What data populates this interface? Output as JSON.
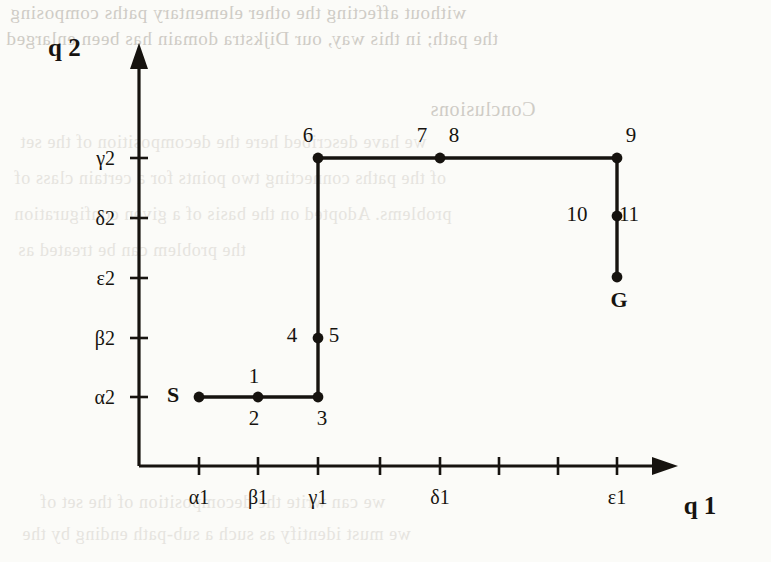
{
  "page": {
    "background_color": "#fbfbf8",
    "ink_color": "#16130f",
    "ghost_color": "#d9d7d2"
  },
  "figure": {
    "axes": {
      "x_title": "q 1",
      "y_title": "q 2",
      "origin_px": {
        "x": 139,
        "y": 466
      },
      "x_arrow_tip_px": 678,
      "y_arrow_tip_px": 43,
      "x_ticks": [
        {
          "px": 199,
          "label": "α1"
        },
        {
          "px": 258,
          "label": "β1"
        },
        {
          "px": 318,
          "label": "γ1"
        },
        {
          "px": 380,
          "label": ""
        },
        {
          "px": 440,
          "label": "δ1"
        },
        {
          "px": 499,
          "label": ""
        },
        {
          "px": 558,
          "label": ""
        },
        {
          "px": 617,
          "label": "ε1"
        }
      ],
      "y_ticks": [
        {
          "px": 158,
          "label": "γ2"
        },
        {
          "px": 218,
          "label": "δ2"
        },
        {
          "px": 278,
          "label": "ε2"
        },
        {
          "px": 338,
          "label": "β2"
        },
        {
          "px": 397,
          "label": "α2"
        }
      ]
    },
    "path_polyline_px": [
      {
        "x": 199,
        "y": 397
      },
      {
        "x": 318,
        "y": 397
      },
      {
        "x": 318,
        "y": 158
      },
      {
        "x": 617,
        "y": 158
      },
      {
        "x": 617,
        "y": 277
      }
    ],
    "nodes": [
      {
        "id": "S",
        "x": 199,
        "y": 397,
        "label": "S",
        "label_dx": -26,
        "label_dy": 5,
        "kind": "endpoint"
      },
      {
        "id": "1",
        "x": 258,
        "y": 397,
        "label": "1",
        "label_dx": -4,
        "label_dy": -14,
        "kind": "waypoint"
      },
      {
        "id": "2",
        "x": 258,
        "y": 397,
        "label": "2",
        "label_dx": -4,
        "label_dy": 28,
        "kind": "waypoint-label-only"
      },
      {
        "id": "3",
        "x": 318,
        "y": 397,
        "label": "3",
        "label_dx": 4,
        "label_dy": 28,
        "kind": "waypoint"
      },
      {
        "id": "4",
        "x": 318,
        "y": 338,
        "label": "4",
        "label_dx": -26,
        "label_dy": 4,
        "kind": "waypoint-label-only"
      },
      {
        "id": "5",
        "x": 318,
        "y": 338,
        "label": "5",
        "label_dx": 16,
        "label_dy": 4,
        "kind": "waypoint"
      },
      {
        "id": "6",
        "x": 318,
        "y": 158,
        "label": "6",
        "label_dx": -10,
        "label_dy": -16,
        "kind": "corner"
      },
      {
        "id": "7",
        "x": 440,
        "y": 158,
        "label": "7",
        "label_dx": -18,
        "label_dy": -16,
        "kind": "waypoint-label-only"
      },
      {
        "id": "8",
        "x": 440,
        "y": 158,
        "label": "8",
        "label_dx": 14,
        "label_dy": -16,
        "kind": "waypoint"
      },
      {
        "id": "9",
        "x": 617,
        "y": 158,
        "label": "9",
        "label_dx": 14,
        "label_dy": -16,
        "kind": "corner"
      },
      {
        "id": "10",
        "x": 617,
        "y": 216,
        "label": "10",
        "label_dx": -40,
        "label_dy": 5,
        "kind": "waypoint-label-only"
      },
      {
        "id": "11",
        "x": 617,
        "y": 216,
        "label": "11",
        "label_dx": 12,
        "label_dy": 5,
        "kind": "waypoint"
      },
      {
        "id": "G",
        "x": 617,
        "y": 277,
        "label": "G",
        "label_dx": 2,
        "label_dy": 30,
        "kind": "endpoint"
      }
    ]
  },
  "ghost_lines": [
    {
      "text": "without affecting the other elementary paths composing",
      "x": 10,
      "y": 2,
      "size": 19,
      "shade": "strong"
    },
    {
      "text": "the path; in this way, our Dijkstra domain has been enlarged",
      "x": 6,
      "y": 28,
      "size": 19,
      "shade": "strong"
    },
    {
      "text": "Conclusions",
      "x": 430,
      "y": 98,
      "size": 20,
      "shade": "strong"
    },
    {
      "text": "we have described here the decomposition of the set",
      "x": 20,
      "y": 132,
      "size": 18,
      "shade": "faint"
    },
    {
      "text": "of the paths connecting two points for a certain class of",
      "x": 14,
      "y": 168,
      "size": 18,
      "shade": "faint"
    },
    {
      "text": "problems. Adopted on the basis of a given configuration",
      "x": 14,
      "y": 204,
      "size": 18,
      "shade": "faint"
    },
    {
      "text": "the problem can be treated as",
      "x": 18,
      "y": 240,
      "size": 18,
      "shade": "faint"
    },
    {
      "text": "we can write the decomposition of the set of",
      "x": 40,
      "y": 492,
      "size": 18,
      "shade": "faint"
    },
    {
      "text": "we must identify as such a sub-path ending by the",
      "x": 22,
      "y": 524,
      "size": 18,
      "shade": "faint"
    }
  ],
  "chart_data": {
    "type": "line",
    "title": "",
    "xlabel": "q 1",
    "ylabel": "q 2",
    "x_tick_labels": [
      "α1",
      "β1",
      "γ1",
      "",
      "δ1",
      "",
      "",
      "ε1"
    ],
    "y_tick_labels": [
      "α2",
      "β2",
      "ε2",
      "δ2",
      "γ2"
    ],
    "grid": false,
    "legend": "none",
    "series": [
      {
        "name": "staircase path S to G",
        "points": [
          {
            "x": "α1",
            "y": "α2",
            "node": "S"
          },
          {
            "x": "β1",
            "y": "α2",
            "node": "1/2"
          },
          {
            "x": "γ1",
            "y": "α2",
            "node": "3"
          },
          {
            "x": "γ1",
            "y": "β2",
            "node": "4/5"
          },
          {
            "x": "γ1",
            "y": "γ2",
            "node": "6"
          },
          {
            "x": "δ1",
            "y": "γ2",
            "node": "7/8"
          },
          {
            "x": "ε1",
            "y": "γ2",
            "node": "9"
          },
          {
            "x": "ε1",
            "y": "δ2",
            "node": "10/11"
          },
          {
            "x": "ε1",
            "y": "ε2",
            "node": "G"
          }
        ]
      }
    ]
  }
}
